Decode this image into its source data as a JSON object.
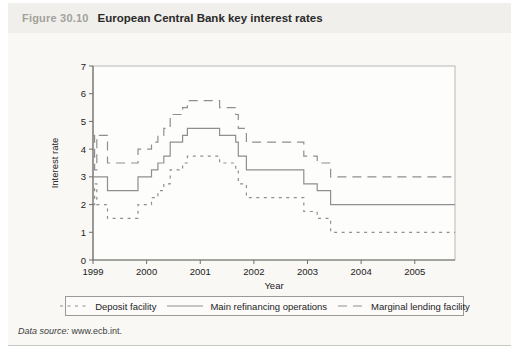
{
  "figure": {
    "label": "Figure 30.10",
    "title": "European Central Bank key interest rates",
    "data_source_label": "Data source:",
    "data_source_value": "www.ecb.int."
  },
  "colors": {
    "line_gray": "#8f8f8f",
    "axis_dark": "#6f6f6f",
    "frame_light": "#b8b8b6",
    "tick_text": "#222222",
    "header_label_gray": "#a3a19d",
    "panel_bg": "#f9f8f5",
    "header_bg": "#f0efeb"
  },
  "chart_data": {
    "type": "line",
    "subtype": "step-after",
    "title": "",
    "xlabel": "Year",
    "ylabel": "Interest rate",
    "xlim": [
      1999,
      2005.75
    ],
    "ylim": [
      0,
      7
    ],
    "xticks": [
      1999,
      2000,
      2001,
      2002,
      2003,
      2004,
      2005
    ],
    "yticks": [
      0,
      1,
      2,
      3,
      4,
      5,
      6,
      7
    ],
    "grid": false,
    "legend_position": "bottom",
    "series": [
      {
        "name": "Deposit facility",
        "style": "dotted",
        "points": [
          [
            1999.0,
            2.0
          ],
          [
            1999.03,
            2.75
          ],
          [
            1999.07,
            2.0
          ],
          [
            1999.27,
            1.5
          ],
          [
            1999.84,
            2.0
          ],
          [
            2000.09,
            2.25
          ],
          [
            2000.21,
            2.5
          ],
          [
            2000.32,
            2.75
          ],
          [
            2000.44,
            3.25
          ],
          [
            2000.67,
            3.5
          ],
          [
            2000.76,
            3.75
          ],
          [
            2001.36,
            3.5
          ],
          [
            2001.66,
            3.25
          ],
          [
            2001.71,
            2.75
          ],
          [
            2001.86,
            2.25
          ],
          [
            2002.93,
            1.75
          ],
          [
            2003.18,
            1.5
          ],
          [
            2003.43,
            1.0
          ],
          [
            2005.75,
            1.0
          ]
        ]
      },
      {
        "name": "Main refinancing operations",
        "style": "solid",
        "points": [
          [
            1999.0,
            3.0
          ],
          [
            1999.27,
            2.5
          ],
          [
            1999.84,
            3.0
          ],
          [
            2000.09,
            3.25
          ],
          [
            2000.21,
            3.5
          ],
          [
            2000.32,
            3.75
          ],
          [
            2000.44,
            4.25
          ],
          [
            2000.67,
            4.5
          ],
          [
            2000.76,
            4.75
          ],
          [
            2001.36,
            4.5
          ],
          [
            2001.66,
            4.25
          ],
          [
            2001.71,
            3.75
          ],
          [
            2001.86,
            3.25
          ],
          [
            2002.93,
            2.75
          ],
          [
            2003.18,
            2.5
          ],
          [
            2003.43,
            2.0
          ],
          [
            2005.75,
            2.0
          ]
        ]
      },
      {
        "name": "Marginal lending facility",
        "style": "dashed",
        "points": [
          [
            1999.0,
            4.5
          ],
          [
            1999.03,
            3.25
          ],
          [
            1999.07,
            4.5
          ],
          [
            1999.27,
            3.5
          ],
          [
            1999.84,
            4.0
          ],
          [
            2000.09,
            4.25
          ],
          [
            2000.21,
            4.5
          ],
          [
            2000.32,
            4.75
          ],
          [
            2000.44,
            5.25
          ],
          [
            2000.67,
            5.5
          ],
          [
            2000.76,
            5.75
          ],
          [
            2001.36,
            5.5
          ],
          [
            2001.66,
            5.25
          ],
          [
            2001.71,
            4.75
          ],
          [
            2001.86,
            4.25
          ],
          [
            2002.93,
            3.75
          ],
          [
            2003.18,
            3.5
          ],
          [
            2003.43,
            3.0
          ],
          [
            2005.75,
            3.0
          ]
        ]
      }
    ]
  }
}
